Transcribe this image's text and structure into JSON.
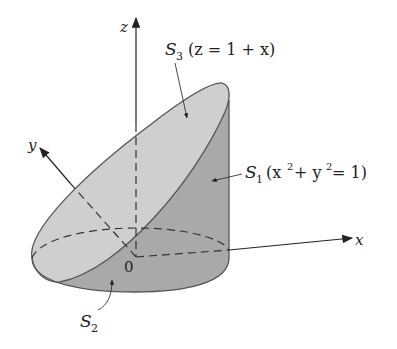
{
  "figure": {
    "labels": {
      "z_axis": "z",
      "y_axis": "y",
      "x_axis": "x",
      "origin": "0",
      "s3_name": "S",
      "s3_sub": "3",
      "s3_eq": "(z = 1 + x)",
      "s1_name": "S",
      "s1_sub": "1",
      "s1_eq_open": "(x",
      "s1_sup1": "2",
      "s1_eq_mid": " + y",
      "s1_sup2": "2",
      "s1_eq_close": " = 1)",
      "s2_name": "S",
      "s2_sub": "2"
    },
    "colors": {
      "top_surface": "#cfcfcf",
      "side_surface": "#a9a9a9",
      "bottom_surface": "#bdbdbd",
      "outline": "#555555",
      "axis": "#222222"
    }
  }
}
